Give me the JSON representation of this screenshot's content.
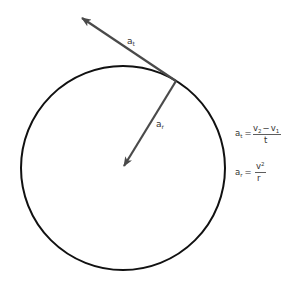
{
  "diagram": {
    "title": "",
    "circle": {
      "cx": 123,
      "cy": 168,
      "r": 102,
      "stroke": "#111111"
    },
    "contact_point": {
      "x": 176,
      "y": 81
    },
    "vectors": {
      "tangential": {
        "label": "a",
        "subscript": "t",
        "from": [
          176,
          81
        ],
        "to": [
          80,
          17
        ],
        "color": "#4a4a4a"
      },
      "radial": {
        "label": "a",
        "subscript": "r",
        "from": [
          176,
          81
        ],
        "to": [
          123,
          167
        ],
        "color": "#4a4a4a"
      }
    },
    "formulas": {
      "tangential": {
        "lhs": "a",
        "lhs_sub": "t",
        "eq": "=",
        "numerator_a": "v",
        "numerator_a_sub": "2",
        "minus": "−",
        "numerator_b": "v",
        "numerator_b_sub": "1",
        "denominator": "t"
      },
      "radial": {
        "lhs": "a",
        "lhs_sub": "r",
        "eq": "=",
        "numerator": "v",
        "numerator_sup": "2",
        "denominator": "r"
      }
    }
  }
}
